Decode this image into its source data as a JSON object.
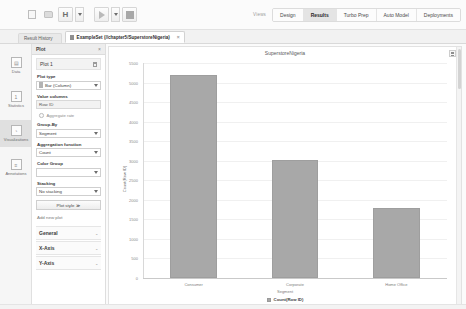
{
  "toolbar": {
    "icons": [
      {
        "name": "new-document-icon",
        "glyph": "doc"
      },
      {
        "name": "open-folder-icon",
        "glyph": "folder"
      },
      {
        "name": "save-icon",
        "glyph": "save"
      },
      {
        "name": "save-dropdown-icon",
        "glyph": "caret"
      },
      {
        "name": "run-process-icon",
        "glyph": "play"
      },
      {
        "name": "run-dropdown-icon",
        "glyph": "caret"
      },
      {
        "name": "stop-process-icon",
        "glyph": "stop"
      }
    ],
    "views_label": "Views",
    "view_tabs": [
      {
        "label": "Design",
        "active": false
      },
      {
        "label": "Results",
        "active": true
      },
      {
        "label": "Turbo Prep",
        "active": false
      },
      {
        "label": "Auto Model",
        "active": false
      },
      {
        "label": "Deployments",
        "active": false
      }
    ]
  },
  "tabbar": {
    "result_history": "Result History",
    "document_tab": "ExampleSet (//chapter5/SuperstoreNigeria)",
    "close_glyph": "×"
  },
  "rail": {
    "items": [
      {
        "label": "Data",
        "icon": "table-icon",
        "glyph": "▤",
        "active": false
      },
      {
        "label": "Statistics",
        "icon": "statistics-icon",
        "glyph": "1",
        "active": false
      },
      {
        "label": "Visualizations",
        "icon": "chart-icon",
        "glyph": "◔",
        "active": true
      },
      {
        "label": "Annotations",
        "icon": "annotations-icon",
        "glyph": "≡",
        "active": false
      }
    ]
  },
  "plot_panel": {
    "title": "Plot",
    "close_glyph": "×",
    "plot_name": "Plot 1",
    "plot_type_label": "Plot type",
    "plot_type_value": "Bar (Column)",
    "value_columns_label": "Value columns",
    "value_columns_value": "Row ID",
    "aggregate_rate_label": "Aggregate rate",
    "group_by_label": "Group-By",
    "group_by_value": "Segment",
    "aggregation_function_label": "Aggregation function",
    "aggregation_function_value": "Count",
    "color_group_label": "Color Group",
    "color_group_value": "",
    "stacking_label": "Stacking",
    "stacking_value": "No stacking",
    "plot_style_button": "Plot style",
    "plot_style_glyph": "≫",
    "add_new_plot": "Add new plot",
    "sections": [
      {
        "label": "General",
        "chevron": "⌄"
      },
      {
        "label": "X-Axis",
        "chevron": "⌄"
      },
      {
        "label": "Y-Axis",
        "chevron": "⌄"
      }
    ]
  },
  "chart_panel": {
    "menu_icon": "chart-options-icon"
  },
  "chart_data": {
    "type": "bar",
    "title": "SuperstoreNigeria",
    "categories": [
      "Consumer",
      "Corporate",
      "Home Office"
    ],
    "values": [
      5191,
      3020,
      1783
    ],
    "xlabel": "Segment",
    "ylabel": "Count(Row ID)",
    "ylim": [
      0,
      5500
    ],
    "yticks": [
      0,
      500,
      1000,
      1500,
      2000,
      2500,
      3000,
      3500,
      4000,
      4500,
      5000,
      5500
    ],
    "grid": true,
    "legend": [
      {
        "label": "Count(Row ID)",
        "color": "#a8a8a8"
      }
    ],
    "legend_position": "bottom",
    "bar_color": "#a8a8a8"
  }
}
